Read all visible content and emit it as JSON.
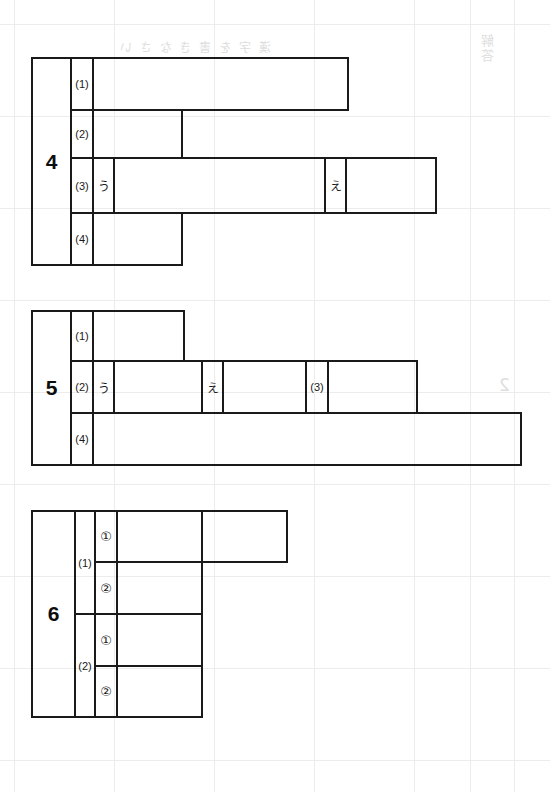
{
  "page": {
    "kind": "answer-sheet",
    "width": 550,
    "height": 792,
    "ink_color": "#1a1a1a",
    "paper_color": "#ffffff",
    "bleed_color": "#d9d9d9"
  },
  "blocks": [
    {
      "number": "4",
      "rows": [
        {
          "label": "(1)",
          "cells": []
        },
        {
          "label": "(2)",
          "cells": []
        },
        {
          "label": "(3)",
          "cells": [
            {
              "text": "う"
            },
            {
              "text": ""
            },
            {
              "text": "え"
            },
            {
              "text": ""
            }
          ]
        },
        {
          "label": "(4)",
          "cells": []
        }
      ]
    },
    {
      "number": "5",
      "rows": [
        {
          "label": "(1)",
          "cells": []
        },
        {
          "label": "(2)",
          "cells": [
            {
              "text": "う"
            },
            {
              "text": ""
            },
            {
              "text": "え"
            },
            {
              "text": ""
            },
            {
              "text": "(3)"
            },
            {
              "text": ""
            }
          ]
        },
        {
          "label": "(4)",
          "cells": []
        }
      ]
    },
    {
      "number": "6",
      "rows": [
        {
          "label": "(1)",
          "subrows": [
            {
              "label": "①",
              "cells": [
                {
                  "text": ""
                },
                {
                  "text": ""
                }
              ]
            },
            {
              "label": "②",
              "cells": [
                {
                  "text": ""
                }
              ]
            }
          ]
        },
        {
          "label": "(2)",
          "subrows": [
            {
              "label": "①",
              "cells": [
                {
                  "text": ""
                }
              ]
            },
            {
              "label": "②",
              "cells": [
                {
                  "text": ""
                }
              ]
            }
          ]
        }
      ]
    }
  ],
  "bleed_text": {
    "header": "漢 字 を 書 き な さ い",
    "corner": "解答",
    "side": "2"
  }
}
